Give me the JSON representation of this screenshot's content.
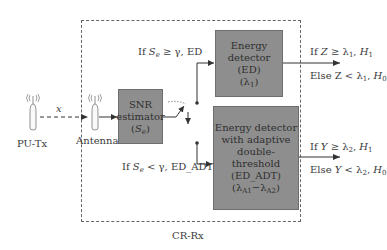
{
  "diagram": {
    "container_label": "CR-Rx",
    "transmitter": {
      "label": "PU-Tx",
      "icon": "radio-tower-icon"
    },
    "receiver_antenna": {
      "label": "Antenna",
      "icon": "radio-tower-icon"
    },
    "signal_label": "x",
    "blocks": {
      "snr": {
        "lines": [
          "SNR",
          "estimator"
        ],
        "symbol": "S",
        "symbol_sub": "e"
      },
      "ed": {
        "lines": [
          "Energy",
          "detector (ED)"
        ],
        "symbol": "λ",
        "symbol_sub": "1"
      },
      "ed_adt": {
        "lines": [
          "Energy detector",
          "with adaptive",
          "double-threshold",
          "(ED_ADT)"
        ],
        "symbol_a": "λ",
        "symbol_a_sub": "A1",
        "dash": "−",
        "symbol_b": "λ",
        "symbol_b_sub": "A2"
      }
    },
    "branch_labels": {
      "upper": {
        "prefix": "If ",
        "var": "S",
        "sub": "e",
        "rest": " ≥ γ, ED"
      },
      "lower": {
        "prefix": "If ",
        "var": "S",
        "sub": "e",
        "rest": " < γ, ED_ADT"
      }
    },
    "outputs": {
      "ed": {
        "line1": {
          "prefix": "If ",
          "var": "Z",
          "op": " ≥ λ",
          "sub": "1",
          "sep": ", ",
          "h": "H",
          "hsub": "1"
        },
        "line2": {
          "prefix": "Else ",
          "var": "Z",
          "op": " < λ",
          "sub": "1",
          "sep": ", ",
          "h": "H",
          "hsub": "0"
        }
      },
      "ed_adt": {
        "line1": {
          "prefix": "If ",
          "var": "Y",
          "op": " ≥ λ",
          "sub": "2",
          "sep": ", ",
          "h": "H",
          "hsub": "1"
        },
        "line2": {
          "prefix": "Else ",
          "var": "Y",
          "op": " < λ",
          "sub": "2",
          "sep": ", ",
          "h": "H",
          "hsub": "0"
        }
      }
    },
    "colors": {
      "block_fill": "#8e8e8e",
      "line": "#333333",
      "border_dashed": "#666666"
    }
  }
}
